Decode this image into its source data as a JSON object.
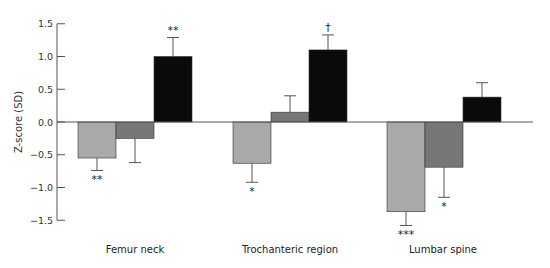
{
  "chart_data": {
    "type": "bar",
    "title": "",
    "xlabel": "",
    "ylabel": "Z-score (SD)",
    "ylim": [
      -1.5,
      1.5
    ],
    "yticks": [
      "1.5",
      "1.0",
      "0.5",
      "0.0",
      "-0.5",
      "-1.0",
      "-1.5"
    ],
    "grid": false,
    "legend": null,
    "categories": [
      "Femur neck",
      "Trochanteric region",
      "Lumbar spine"
    ],
    "series": [
      {
        "name": "Group 1 (light gray)",
        "color": "#a9a9a9",
        "values": [
          -0.55,
          -0.63,
          -1.37
        ],
        "error": [
          0.19,
          0.29,
          0.21
        ],
        "significance": [
          "**",
          "*",
          "***"
        ]
      },
      {
        "name": "Group 2 (dark gray)",
        "color": "#777777",
        "values": [
          -0.25,
          0.15,
          -0.69
        ],
        "error": [
          0.37,
          0.25,
          0.46
        ],
        "significance": [
          "",
          "",
          "*"
        ]
      },
      {
        "name": "Group 3 (black)",
        "color": "#0a0a0a",
        "values": [
          1.0,
          1.1,
          0.38
        ],
        "error": [
          0.29,
          0.23,
          0.22
        ],
        "significance": [
          "**",
          "†",
          ""
        ]
      }
    ]
  }
}
